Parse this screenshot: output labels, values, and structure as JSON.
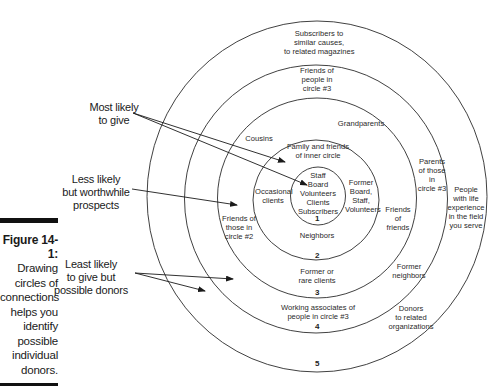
{
  "caption": {
    "figure_label": "Figure 14-1:",
    "lines": [
      "Drawing",
      "circles of",
      "connections",
      "helps you",
      "identify",
      "possible",
      "individual",
      "donors."
    ]
  },
  "callouts": {
    "most_likely": [
      "Most likely",
      "to give"
    ],
    "less_likely": [
      "Less likely",
      "but worthwhile",
      "prospects"
    ],
    "least_likely": [
      "Least likely",
      "to give but",
      "possible donors"
    ]
  },
  "circles": {
    "numbers": [
      "1",
      "2",
      "3",
      "4",
      "5"
    ],
    "circle1": {
      "lines": [
        "Staff",
        "Board",
        "Volunteers",
        "Clients",
        "Subscribers"
      ]
    },
    "circle2": {
      "top": [
        "Family and friends",
        "of inner circle"
      ],
      "left": [
        "Occasional",
        "clients"
      ],
      "right": [
        "Former",
        "Board,",
        "Staff,",
        "Volunteers"
      ],
      "bottom": [
        "Neighbors"
      ]
    },
    "circle3": {
      "top_left": [
        "Cousins"
      ],
      "top_right": [
        "Grandparents"
      ],
      "left": [
        "Friends of",
        "those in",
        "circle #2"
      ],
      "right": [
        "Friends",
        "of",
        "friends"
      ],
      "bottom": [
        "Former or",
        "rare clients"
      ],
      "bottom_right": [
        "Former",
        "neighbors"
      ]
    },
    "circle4": {
      "top": [
        "Friends of",
        "people in",
        "circle #3"
      ],
      "right": [
        "Parents",
        "of those",
        "in",
        "circle #3"
      ],
      "bottom": [
        "Working associates of",
        "people in circle #3"
      ],
      "bottom_right": [
        "Donors",
        "to related",
        "organizations"
      ]
    },
    "circle5": {
      "top": [
        "Subscribers to",
        "similar causes,",
        "to related magazines"
      ],
      "right": [
        "People",
        "with life",
        "experience",
        "in the field",
        "you serve"
      ]
    }
  },
  "colors": {
    "line": "#2b2b2b",
    "text": "#1a1a1a",
    "background": "#ffffff"
  }
}
